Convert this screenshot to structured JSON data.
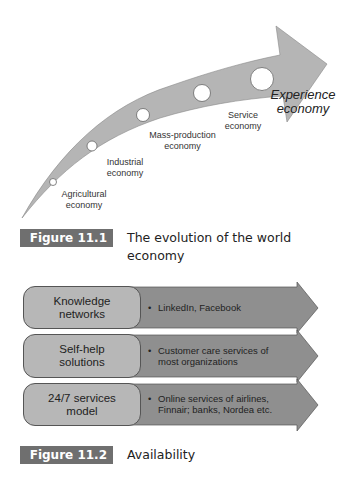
{
  "figure1": {
    "caption_label": "Figure 11.1",
    "caption_text": "The evolution of the world economy",
    "stages": [
      {
        "line1": "Agricultural",
        "line2": "economy"
      },
      {
        "line1": "Industrial",
        "line2": "economy"
      },
      {
        "line1": "Mass-production",
        "line2": "economy"
      },
      {
        "line1": "Service",
        "line2": "economy"
      },
      {
        "line1": "Experience",
        "line2": "economy"
      }
    ],
    "colors": {
      "arrow": "#b5b5b5",
      "caption_box": "#6f6f6f"
    }
  },
  "figure2": {
    "caption_label": "Figure 11.2",
    "caption_text": "Availability",
    "rows": [
      {
        "label1": "Knowledge",
        "label2": "networks",
        "bullet": "•",
        "text1": "LinkedIn, Facebook",
        "text2": ""
      },
      {
        "label1": "Self-help",
        "label2": "solutions",
        "bullet": "•",
        "text1": "Customer care services of",
        "text2": "most organizations"
      },
      {
        "label1": "24/7 services",
        "label2": "model",
        "bullet": "•",
        "text1": "Online services of airlines,",
        "text2": "Finnair; banks, Nordea etc."
      }
    ],
    "colors": {
      "box": "#b7b7b7",
      "arrow": "#8f8f8f"
    }
  }
}
